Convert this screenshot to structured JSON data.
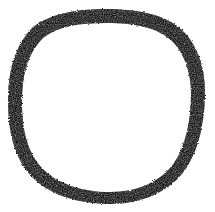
{
  "image": {
    "kind": "scanned-hand-drawn-sketch",
    "subject_name": "hand-drawn-circle",
    "width": 215,
    "height": 212,
    "background_color": "#ffffff",
    "paper_tint": "#fefefe",
    "visible_text": "",
    "caption": "",
    "labels": []
  },
  "stroke": {
    "name": "ink-circle-outline",
    "color": "#0a0a0a",
    "edge_color": "#1a1a1a",
    "medium": "ink-marker",
    "texture": "rough-grainy-edges-with-white-flecks",
    "closed": true,
    "filled": false,
    "min_width_px": 5,
    "max_width_px": 15,
    "bounds": {
      "left": 8,
      "top": 9,
      "right": 205,
      "bottom": 204
    },
    "center": {
      "x": 106,
      "y": 106
    },
    "radius_x": 98,
    "radius_y": 97,
    "outer_path": "M 106 9 C 140 9 166 15 182 30 C 197 44 205 66 205 92 C 205 121 199 150 185 170 C 170 191 143 204 110 204 C 78 204 50 195 32 177 C 14 158 8 131 8 101 C 8 71 15 45 33 27 C 50 14 76 9 106 9 Z",
    "inner_path": "M 106 23 C 136 23 158 28 172 41 C 184 53 191 72 191 94 C 191 119 186 145 174 163 C 161 181 139 192 110 192 C 82 192 58 184 43 169 C 27 153 22 129 22 102 C 22 75 28 53 43 38 C 58 26 80 23 106 23 Z",
    "segments": [
      {
        "name": "segment-top",
        "angle_deg": 270,
        "width_px": 12
      },
      {
        "name": "segment-top-left",
        "angle_deg": 225,
        "width_px": 14
      },
      {
        "name": "segment-left",
        "angle_deg": 180,
        "width_px": 14
      },
      {
        "name": "segment-bottom-left",
        "angle_deg": 135,
        "width_px": 11
      },
      {
        "name": "segment-bottom",
        "angle_deg": 90,
        "width_px": 9
      },
      {
        "name": "segment-bottom-right",
        "angle_deg": 45,
        "width_px": 6
      },
      {
        "name": "segment-right",
        "angle_deg": 0,
        "width_px": 6
      },
      {
        "name": "segment-top-right",
        "angle_deg": 315,
        "width_px": 13
      }
    ]
  }
}
